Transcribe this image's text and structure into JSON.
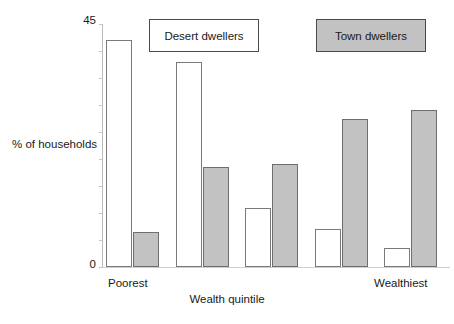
{
  "chart_data": {
    "type": "bar",
    "title": "",
    "xlabel": "Wealth quintile",
    "ylabel": "% of households",
    "ylim": [
      0,
      45
    ],
    "ytick_labels": [
      "0",
      "45"
    ],
    "yticks": [
      0,
      5,
      10,
      15,
      20,
      25,
      30,
      35,
      40,
      45
    ],
    "grid": false,
    "legend_position": "top",
    "categories": [
      "Poorest",
      "2",
      "3",
      "4",
      "Wealthiest"
    ],
    "xtick_labels_shown": [
      "Poorest",
      "Wealthiest"
    ],
    "series": [
      {
        "name": "Desert dwellers",
        "color": "#ffffff",
        "border_color": "#7a7a7a",
        "values": [
          42,
          38,
          11,
          7,
          3.5
        ]
      },
      {
        "name": "Town dwellers",
        "color": "#c2c2c2",
        "border_color": "#6e6e6e",
        "values": [
          6.5,
          18.5,
          19,
          27.5,
          29
        ]
      }
    ]
  },
  "axes": {
    "y_max_label": "45",
    "y_min_label": "0",
    "y_title": "% of households",
    "x_title": "Wealth quintile",
    "x_first_label": "Poorest",
    "x_last_label": "Wealthiest"
  },
  "legend": {
    "items": [
      {
        "label": "Desert dwellers",
        "swatch": "#ffffff"
      },
      {
        "label": "Town dwellers",
        "swatch": "#c2c2c2"
      }
    ]
  }
}
